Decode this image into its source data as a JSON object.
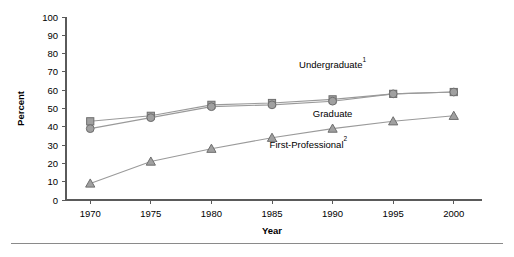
{
  "chart_data": {
    "type": "line",
    "title": "",
    "xlabel": "Year",
    "ylabel": "Percent",
    "x": [
      1970,
      1975,
      1980,
      1985,
      1990,
      1995,
      2000
    ],
    "xtick_labels": [
      "1970",
      "1975",
      "1980",
      "1985",
      "1990",
      "1995",
      "2000"
    ],
    "ytick_labels": [
      "0",
      "10",
      "20",
      "30",
      "40",
      "50",
      "60",
      "70",
      "80",
      "90",
      "100"
    ],
    "yticks": [
      0,
      10,
      20,
      30,
      40,
      50,
      60,
      70,
      80,
      90,
      100
    ],
    "ylim": [
      0,
      100
    ],
    "xlim": [
      1968,
      2002
    ],
    "grid": false,
    "legend_position": "inline-annotations",
    "series": [
      {
        "name": "Undergraduate",
        "label": "Undergraduate",
        "superscript": "1",
        "marker": "square",
        "color": "#a0a0a0",
        "values": [
          43,
          46,
          52,
          53,
          55,
          58,
          59
        ]
      },
      {
        "name": "Graduate",
        "label": "Graduate",
        "superscript": "",
        "marker": "circle",
        "color": "#a0a0a0",
        "values": [
          39,
          45,
          51,
          52,
          54,
          58,
          59
        ]
      },
      {
        "name": "First-Professional",
        "label": "First-Professional",
        "superscript": "2",
        "marker": "triangle",
        "color": "#a0a0a0",
        "values": [
          9,
          21,
          28,
          34,
          39,
          43,
          46
        ]
      }
    ],
    "annotations": [
      {
        "text": "Undergraduate",
        "superscript": "1",
        "x": 1990,
        "y": 72
      },
      {
        "text": "Graduate",
        "superscript": "",
        "x": 1990,
        "y": 45.5
      },
      {
        "text": "First-Professional",
        "superscript": "2",
        "x": 1988,
        "y": 28.5
      }
    ]
  }
}
